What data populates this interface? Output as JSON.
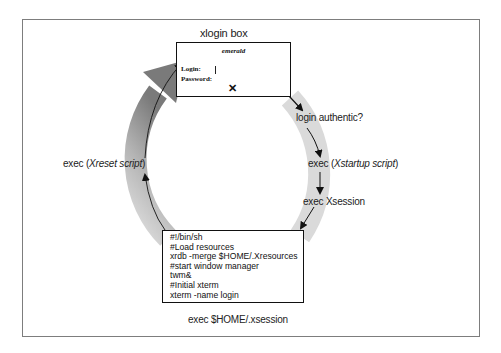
{
  "diagram": {
    "xlogin_box": {
      "title": "xlogin box",
      "hostname": "emerald",
      "login_label": "Login:",
      "password_label": "Password:",
      "cursor_icon": "text-cursor",
      "x_cursor_icon": "x-cursor"
    },
    "labels": {
      "login_authentic": "login authentic?",
      "xstartup_prefix": "exec (",
      "xstartup_script": "Xstartup script",
      "xstartup_suffix": ")",
      "exec_xsession": "exec Xsession",
      "xreset_prefix": "exec (",
      "xreset_script": "Xreset script",
      "xreset_suffix": ")",
      "exec_home_xsession": "exec $HOME/.xsession"
    },
    "xsession_script": {
      "lines": [
        "#!/bin/sh",
        "#Load resources",
        "xrdb -merge $HOME/.Xresources",
        "#start window manager",
        "twm&",
        "#Initial xterm",
        "xterm -name login"
      ]
    },
    "colors": {
      "frame_border": "#7d7d7d",
      "ring_light": "#d9d9d9",
      "ring_dark": "#8c8c8c",
      "box_border": "#111111",
      "text": "#222222"
    }
  }
}
